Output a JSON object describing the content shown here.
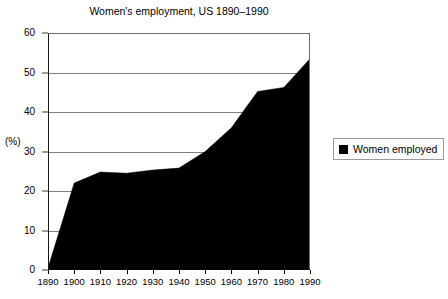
{
  "chart_data": {
    "type": "area",
    "title": "Women's employment, US 1890–1990",
    "xlabel": "",
    "ylabel": "(%)",
    "ylim": [
      0,
      60
    ],
    "xlim": [
      1890,
      1990
    ],
    "grid": true,
    "legend_position": "right",
    "y_ticks": [
      0,
      10,
      20,
      30,
      40,
      50,
      60
    ],
    "y_tick_labels": [
      "0",
      "10",
      "20",
      "30",
      "40",
      "50",
      "60"
    ],
    "x": [
      1890,
      1900,
      1910,
      1920,
      1930,
      1940,
      1950,
      1960,
      1970,
      1980,
      1990
    ],
    "x_tick_labels": [
      "1890",
      "1900",
      "1910",
      "1920",
      "1930",
      "1940",
      "1950",
      "1960",
      "1970",
      "1980",
      "1990"
    ],
    "series": [
      {
        "name": "Women employed",
        "color": "#000000",
        "values": [
          0.5,
          22.0,
          24.8,
          24.5,
          25.3,
          25.8,
          30.0,
          36.0,
          45.2,
          46.2,
          53.5
        ]
      }
    ],
    "annotations": []
  },
  "legend": {
    "entries": [
      {
        "label": "Women employed",
        "swatch_color": "#000000"
      }
    ]
  }
}
